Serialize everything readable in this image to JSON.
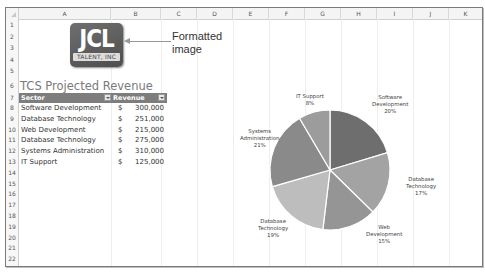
{
  "sheet": {
    "columns": [
      "A",
      "B",
      "C",
      "D",
      "E",
      "F",
      "G",
      "H",
      "I",
      "J",
      "K"
    ],
    "rows": [
      "1",
      "2",
      "3",
      "4",
      "5",
      "6",
      "7",
      "8",
      "9",
      "10",
      "11",
      "12",
      "13",
      "14",
      "15",
      "16",
      "17",
      "18",
      "19",
      "20",
      "21",
      "22"
    ]
  },
  "logo": {
    "main_text": "JCL",
    "sub_text": "TALENT, INC"
  },
  "callout": {
    "line1": "Formatted",
    "line2": "image"
  },
  "title": "TCS Projected Revenue",
  "table": {
    "headers": {
      "sector": "Sector",
      "revenue": "Revenue"
    },
    "rows": [
      {
        "sector": "Software Development",
        "currency": "$",
        "revenue": "300,000"
      },
      {
        "sector": "Database Technology",
        "currency": "$",
        "revenue": "251,000"
      },
      {
        "sector": "Web Development",
        "currency": "$",
        "revenue": "215,000"
      },
      {
        "sector": "Database Technology",
        "currency": "$",
        "revenue": "275,000"
      },
      {
        "sector": "Systems Administration",
        "currency": "$",
        "revenue": "310,000"
      },
      {
        "sector": "IT Support",
        "currency": "$",
        "revenue": "125,000"
      }
    ]
  },
  "chart_data": {
    "type": "pie",
    "title": "",
    "categories": [
      "Software Development",
      "Database Technology",
      "Web Development",
      "Database Technology",
      "Systems Administration",
      "IT Support"
    ],
    "values": [
      300000,
      251000,
      215000,
      275000,
      310000,
      125000
    ],
    "percent_labels": [
      "20%",
      "17%",
      "15%",
      "19%",
      "21%",
      "8%"
    ],
    "colors": [
      "#6e6e6e",
      "#a3a3a3",
      "#959595",
      "#bdbdbd",
      "#8a8a8a",
      "#9c9c9c"
    ],
    "legend": "none",
    "data_labels": [
      {
        "line1": "Software",
        "line2": "Development",
        "pct": "20%"
      },
      {
        "line1": "Database",
        "line2": "Technology",
        "pct": "17%"
      },
      {
        "line1": "Web",
        "line2": "Development",
        "pct": "15%"
      },
      {
        "line1": "Database",
        "line2": "Technology",
        "pct": "19%"
      },
      {
        "line1": "Systems",
        "line2": "Administration",
        "pct": "21%"
      },
      {
        "line1": "IT Support",
        "line2": "",
        "pct": "8%"
      }
    ]
  }
}
